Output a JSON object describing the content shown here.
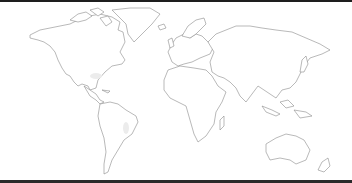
{
  "map": {
    "title": "World map outline",
    "style": "outline",
    "colors": {
      "background": "#ffffff",
      "outline": "#8a8a8a",
      "frame": "#1e1e1e"
    },
    "regions": [
      "North America",
      "Greenland",
      "South America",
      "Europe",
      "Africa",
      "Asia",
      "Australia",
      "New Zealand",
      "Antarctica-absent"
    ]
  }
}
